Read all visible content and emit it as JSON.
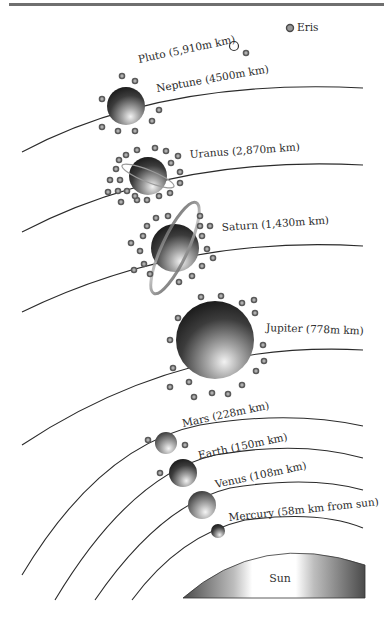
{
  "diagram": {
    "colors": {
      "background": "#ffffff",
      "top_rule": "#6f6f6f",
      "orbit": "#2b2b2b",
      "planet_dark": "#1e1e1e",
      "planet_light": "#d9d9d9",
      "moon_fill": "#b0b0b0",
      "moon_stroke": "#5a5a5a"
    },
    "sun": {
      "label": "Sun"
    },
    "planets": [
      {
        "name": "Mercury",
        "label": "Mercury (58m km from sun)",
        "distance": "58m km"
      },
      {
        "name": "Venus",
        "label": "Venus (108m km)",
        "distance": "108m km"
      },
      {
        "name": "Earth",
        "label": "Earth (150m km)",
        "distance": "150m km",
        "moons_shown": 1
      },
      {
        "name": "Mars",
        "label": "Mars (228m km)",
        "distance": "228m km",
        "moons_shown": 2
      },
      {
        "name": "Jupiter",
        "label": "Jupiter (778m km)",
        "distance": "778m km"
      },
      {
        "name": "Saturn",
        "label": "Saturn (1,430m km)",
        "distance": "1,430m km",
        "has_rings": true
      },
      {
        "name": "Uranus",
        "label": "Uranus (2,870m km)",
        "distance": "2,870m km",
        "has_rings": true
      },
      {
        "name": "Neptune",
        "label": "Neptune (4500m km)",
        "distance": "4500m km"
      }
    ],
    "dwarf_planets": [
      {
        "name": "Pluto",
        "label": "Pluto (5,910m km)",
        "distance": "5,910m km"
      },
      {
        "name": "Eris",
        "label": "Eris"
      }
    ]
  }
}
